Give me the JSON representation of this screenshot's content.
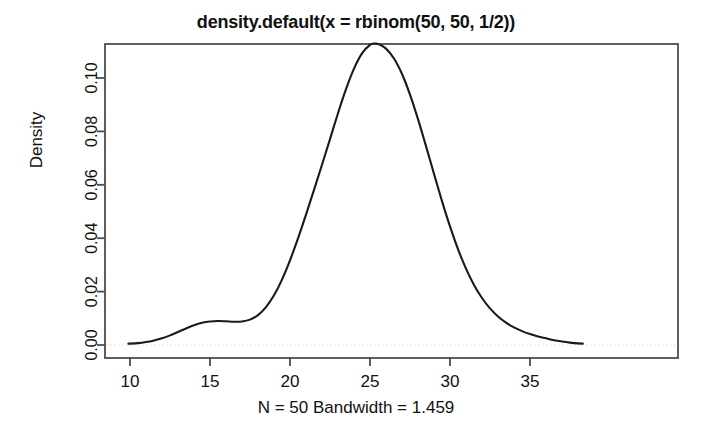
{
  "figure": {
    "title": "density.default(x = rbinom(50, 50, 1/2))",
    "caption": "N = 50   Bandwidth = 1.459",
    "background_color": "#ffffff",
    "line_color": "#1a1a1a",
    "zero_line_color": "#d9d9d9",
    "axis_color": "#4d4d4d"
  },
  "chart_data": {
    "type": "line",
    "title": "density.default(x = rbinom(50, 50, 1/2))",
    "subtitle": "N = 50   Bandwidth = 1.459",
    "xlabel": "",
    "ylabel": "Density",
    "xlim": [
      9.5,
      38.3
    ],
    "ylim": [
      0.0,
      0.118
    ],
    "grid": false,
    "legend": "none",
    "annotations": [
      "N = 50",
      "Bandwidth = 1.459"
    ],
    "zero_reference_line": 0.0,
    "x_ticks": [
      10,
      15,
      20,
      25,
      30,
      35
    ],
    "x_tick_labels": [
      "10",
      "15",
      "20",
      "25",
      "30",
      "35"
    ],
    "y_ticks": [
      0.0,
      0.02,
      0.04,
      0.06,
      0.08,
      0.1
    ],
    "y_tick_labels": [
      "0.00",
      "0.02",
      "0.04",
      "0.06",
      "0.08",
      "0.10"
    ],
    "series": [
      {
        "name": "density",
        "x": [
          9.9,
          10.5,
          11.0,
          11.5,
          12.0,
          12.5,
          13.0,
          13.5,
          14.0,
          14.5,
          15.0,
          15.5,
          16.0,
          16.5,
          17.0,
          17.5,
          18.0,
          18.5,
          19.0,
          19.5,
          20.0,
          20.5,
          21.0,
          21.5,
          22.0,
          22.5,
          23.0,
          23.5,
          24.0,
          24.5,
          25.0,
          25.3,
          25.6,
          26.0,
          26.5,
          27.0,
          27.5,
          28.0,
          28.5,
          29.0,
          29.5,
          30.0,
          30.5,
          31.0,
          31.5,
          32.0,
          32.5,
          33.0,
          33.5,
          34.0,
          34.5,
          35.0,
          35.5,
          36.0,
          36.5,
          37.0,
          37.5,
          38.0,
          38.3
        ],
        "y": [
          0.0005,
          0.0007,
          0.0011,
          0.0017,
          0.0025,
          0.0036,
          0.0049,
          0.0062,
          0.0074,
          0.0083,
          0.0088,
          0.009,
          0.0089,
          0.0087,
          0.0088,
          0.0095,
          0.0112,
          0.0142,
          0.0186,
          0.0245,
          0.0317,
          0.0399,
          0.0488,
          0.0581,
          0.0675,
          0.0771,
          0.0868,
          0.0958,
          0.1035,
          0.1092,
          0.1124,
          0.1129,
          0.1125,
          0.111,
          0.1073,
          0.1015,
          0.0938,
          0.0846,
          0.0745,
          0.0641,
          0.0539,
          0.0444,
          0.0359,
          0.0286,
          0.0225,
          0.0176,
          0.0137,
          0.0107,
          0.0084,
          0.0066,
          0.0052,
          0.0041,
          0.0032,
          0.0025,
          0.0018,
          0.0013,
          0.0009,
          0.0006,
          0.0005
        ]
      }
    ]
  }
}
